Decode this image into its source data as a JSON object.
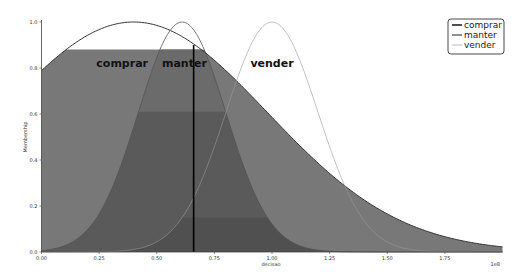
{
  "chart_data": {
    "type": "area",
    "title": "",
    "xlabel": "decisao",
    "ylabel": "Membership",
    "x_scale_label": "1e8",
    "xlim": [
      0,
      2.0
    ],
    "ylim": [
      0,
      1.0
    ],
    "x_ticks": [
      "0.00",
      "0.25",
      "0.50",
      "0.75",
      "1.00",
      "1.25",
      "1.50",
      "1.75"
    ],
    "y_ticks": [
      "0.0",
      "0.2",
      "0.4",
      "0.6",
      "0.8",
      "1.0"
    ],
    "grid": false,
    "legend_position": "upper right",
    "series": [
      {
        "name": "comprar",
        "shape": "gaussian",
        "center": 0.4,
        "sigma": 0.58,
        "line_color": "#333333",
        "line_width": 1.0,
        "clip_level": 0.88
      },
      {
        "name": "manter",
        "shape": "gaussian",
        "center": 0.61,
        "sigma": 0.19,
        "line_color": "#555555",
        "line_width": 0.8,
        "clip_level": 0.61
      },
      {
        "name": "vender",
        "shape": "gaussian",
        "center": 1.0,
        "sigma": 0.2,
        "line_color": "#999999",
        "line_width": 0.6,
        "clip_level": 0.15
      }
    ],
    "vertical_line": {
      "x": 0.66,
      "color": "#000000",
      "label": "decision output"
    },
    "annotations": [
      {
        "text": "comprar",
        "x": 0.35,
        "y": 0.82
      },
      {
        "text": "manter",
        "x": 0.62,
        "y": 0.82
      },
      {
        "text": "vender",
        "x": 1.0,
        "y": 0.82
      }
    ]
  },
  "legend": {
    "items": [
      {
        "label": "comprar",
        "color": "#222222",
        "width": 1.6
      },
      {
        "label": "manter",
        "color": "#555555",
        "width": 1.3
      },
      {
        "label": "vender",
        "color": "#aaaaaa",
        "width": 0.8
      }
    ]
  },
  "colors": {
    "fill_comprar": "#6b6b6b",
    "fill_manter": "#5a5a5a",
    "fill_vender": "#505050",
    "fill_outer": "#787878",
    "axis": "#444444"
  }
}
